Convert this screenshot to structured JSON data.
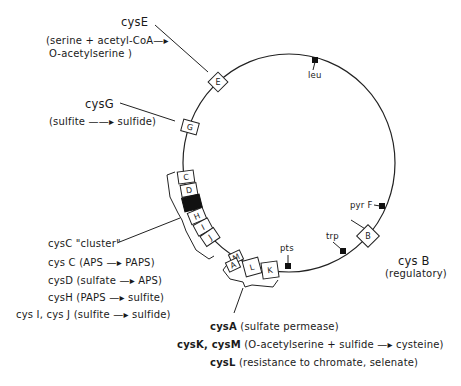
{
  "map": {
    "genes_on_circle": [
      {
        "id": "E",
        "label": "E"
      },
      {
        "id": "G",
        "label": "G"
      },
      {
        "id": "C",
        "label": "C"
      },
      {
        "id": "D",
        "label": "D"
      },
      {
        "id": "H",
        "label": "H"
      },
      {
        "id": "I",
        "label": "I"
      },
      {
        "id": "J",
        "label": "J"
      },
      {
        "id": "M",
        "label": "M"
      },
      {
        "id": "A",
        "label": "A"
      },
      {
        "id": "L",
        "label": "L"
      },
      {
        "id": "K",
        "label": "K"
      },
      {
        "id": "B",
        "label": "B"
      }
    ],
    "markers": {
      "leu": "leu",
      "pyrF": "pyr F",
      "trp": "trp",
      "pts": "pts"
    }
  },
  "annotations": {
    "cysE": {
      "name": "cysE",
      "line1": "(serine + acetyl-CoA—▸",
      "line2": "O-acetylserine )"
    },
    "cysG": {
      "name": "cysG",
      "desc": "(sulfite ——▸ sulfide)"
    },
    "cysB": {
      "name": "cys B",
      "desc": "(regulatory)"
    },
    "cluster": {
      "title": "cysC \"cluster\"",
      "items": [
        "cys C (APS —▸ PAPS)",
        "cysD (sulfate —▸ APS)",
        "cysH (PAPS —▸ sulfite)",
        "cys I, cys J (sulfite —▸ sulfide)"
      ]
    },
    "cysA_group": {
      "items": [
        {
          "name": "cysA",
          "desc": "(sulfate permease)"
        },
        {
          "name": "cysK, cysM",
          "desc": "(O-acetylserine + sulfide —▸ cysteine)"
        },
        {
          "name": "cysL",
          "desc": "(resistance to chromate, selenate)"
        }
      ]
    }
  }
}
